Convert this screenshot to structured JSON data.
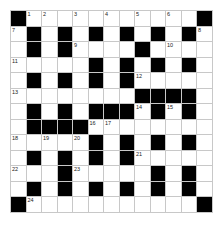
{
  "puzzle": {
    "rows": 13,
    "cols": 13,
    "colors": {
      "block": "#000000",
      "cell": "#ffffff",
      "gridline": "#c8c8c8"
    },
    "grid": [
      "#...........#",
      ".#.#.#.#.#.#.",
      ".#.#....#....",
      ".....#.#.#.#.",
      ".#.#.#.#.....",
      "........####.",
      ".#.#.###.#.#.",
      ".####........",
      ".....#.#.#.#.",
      ".#.#.#.#.....",
      "...#.....#.#.",
      ".#.#.#.#.#.#.",
      "#...........#"
    ],
    "numbers": [
      {
        "r": 0,
        "c": 1,
        "n": "1"
      },
      {
        "r": 0,
        "c": 2,
        "n": "2"
      },
      {
        "r": 0,
        "c": 4,
        "n": "3"
      },
      {
        "r": 0,
        "c": 6,
        "n": "4"
      },
      {
        "r": 0,
        "c": 8,
        "n": "5"
      },
      {
        "r": 0,
        "c": 10,
        "n": "6"
      },
      {
        "r": 1,
        "c": 0,
        "n": "7"
      },
      {
        "r": 1,
        "c": 12,
        "n": "8"
      },
      {
        "r": 2,
        "c": 4,
        "n": "9"
      },
      {
        "r": 2,
        "c": 10,
        "n": "10"
      },
      {
        "r": 3,
        "c": 0,
        "n": "11"
      },
      {
        "r": 4,
        "c": 8,
        "n": "12"
      },
      {
        "r": 5,
        "c": 0,
        "n": "13"
      },
      {
        "r": 6,
        "c": 8,
        "n": "14"
      },
      {
        "r": 6,
        "c": 10,
        "n": "15"
      },
      {
        "r": 7,
        "c": 5,
        "n": "16"
      },
      {
        "r": 7,
        "c": 6,
        "n": "17"
      },
      {
        "r": 8,
        "c": 0,
        "n": "18"
      },
      {
        "r": 8,
        "c": 2,
        "n": "19"
      },
      {
        "r": 8,
        "c": 4,
        "n": "20"
      },
      {
        "r": 9,
        "c": 8,
        "n": "21"
      },
      {
        "r": 10,
        "c": 0,
        "n": "22"
      },
      {
        "r": 10,
        "c": 4,
        "n": "23"
      },
      {
        "r": 12,
        "c": 1,
        "n": "24"
      }
    ]
  }
}
